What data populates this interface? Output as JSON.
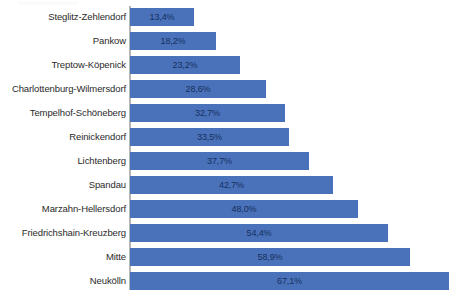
{
  "chart_data": {
    "type": "bar",
    "orientation": "horizontal",
    "title": "",
    "subtitle": "",
    "xlabel": "",
    "ylabel": "",
    "xlim": [
      0,
      67.1
    ],
    "grid": false,
    "legend": null,
    "value_suffix": "%",
    "decimal_separator": ",",
    "axis_color": "#b6b6b6",
    "bar_color": "#4a72ba",
    "label_color": "#16305e",
    "categories": [
      "Steglitz-Zehlendorf",
      "Pankow",
      "Treptow-Köpenick",
      "Charlottenburg-Wilmersdorf",
      "Tempelhof-Schöneberg",
      "Reinickendorf",
      "Lichtenberg",
      "Spandau",
      "Marzahn-Hellersdorf",
      "Friedrichshain-Kreuzberg",
      "Mitte",
      "Neukölln"
    ],
    "values": [
      13.4,
      18.2,
      23.2,
      28.6,
      32.7,
      33.5,
      37.7,
      42.7,
      48.0,
      54.4,
      58.9,
      67.1
    ],
    "value_labels": [
      "13,4%",
      "18,2%",
      "23,2%",
      "28,6%",
      "32,7%",
      "33,5%",
      "37,7%",
      "42,7%",
      "48,0%",
      "54,4%",
      "58,9%",
      "67,1%"
    ]
  }
}
